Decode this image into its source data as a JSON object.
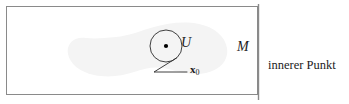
{
  "figure": {
    "caption": "innerer Punkt",
    "frame": {
      "stroke_color": "#8a8a8a",
      "fill_color": "#ffffff"
    },
    "set_region": {
      "name": "M",
      "label": "M",
      "fill_color": "#f4f4f4"
    },
    "neighborhood": {
      "name": "U",
      "label": "U",
      "stroke_color": "#2b2b2b",
      "center_dot_color": "#000000"
    },
    "point": {
      "symbol": "x",
      "subscript": "0"
    },
    "divider": {
      "stroke_color": "#8a8a8a"
    }
  }
}
